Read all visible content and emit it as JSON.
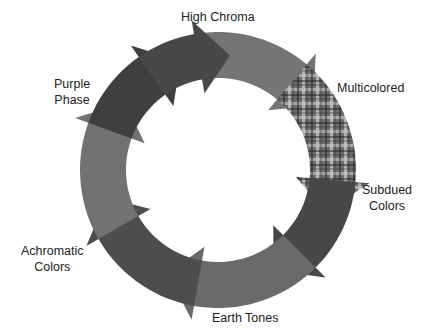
{
  "diagram": {
    "type": "cycle",
    "center": [
      218,
      170
    ],
    "outer_radius": 138,
    "inner_radius": 92,
    "segments": [
      {
        "id": "high-chroma",
        "label": "High Chroma",
        "color": "#757575",
        "start": -100,
        "end": -50,
        "pattern": "solid"
      },
      {
        "id": "multicolored",
        "label": "Multicolored",
        "color": "#6d6d6d",
        "start": -50,
        "end": 5,
        "pattern": "plaid"
      },
      {
        "id": "subdued",
        "label": "Subdued Colors",
        "color": "#474747",
        "start": 5,
        "end": 45,
        "pattern": "solid"
      },
      {
        "id": "earth-light",
        "label": "Earth Tones",
        "color": "#6a6a6a",
        "start": 45,
        "end": 100,
        "pattern": "solid"
      },
      {
        "id": "earth-dark",
        "label": "Earth Tones",
        "color": "#4d4d4d",
        "start": 100,
        "end": 150,
        "pattern": "solid"
      },
      {
        "id": "achromatic",
        "label": "Achromatic Colors",
        "color": "#727272",
        "start": 150,
        "end": 200,
        "pattern": "solid"
      },
      {
        "id": "purple",
        "label": "Purple Phase",
        "color": "#3f3f3f",
        "start": 200,
        "end": 235,
        "pattern": "solid"
      },
      {
        "id": "top-left",
        "label": "Purple Phase",
        "color": "#484848",
        "start": 235,
        "end": 260,
        "pattern": "solid"
      }
    ]
  },
  "labels": {
    "high_chroma": "High Chroma",
    "multicolored": "Multicolored",
    "subdued_1": "Subdued",
    "subdued_2": "Colors",
    "earth_tones": "Earth Tones",
    "achromatic_1": "Achromatic",
    "achromatic_2": "Colors",
    "purple_1": "Purple",
    "purple_2": "Phase"
  }
}
